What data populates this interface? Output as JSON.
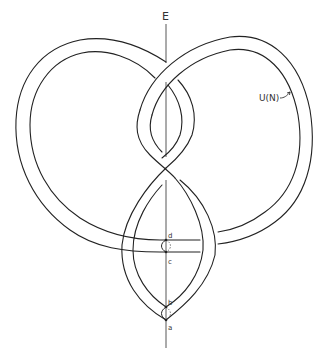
{
  "figure": {
    "type": "knot-diagram",
    "labels": {
      "axis": "E",
      "neighborhood": "U(N)",
      "point_a": "a",
      "point_b": "b",
      "point_c": "c",
      "point_d": "d"
    },
    "colors": {
      "line": "#222222",
      "background": "#ffffff"
    }
  }
}
